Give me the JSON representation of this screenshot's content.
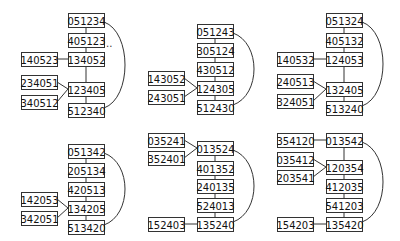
{
  "figure": {
    "box_width": 36,
    "box_height": 14,
    "colors": {
      "stroke": "#333333",
      "fill": "#ffffff",
      "text": "#111111"
    }
  },
  "panels": [
    {
      "id": "panel-1",
      "nodes": [
        {
          "id": "a",
          "label": "051234",
          "x": 68,
          "y": 13
        },
        {
          "id": "b",
          "label": "405123",
          "x": 68,
          "y": 33
        },
        {
          "id": "c",
          "label": "134052",
          "x": 68,
          "y": 52
        },
        {
          "id": "d",
          "label": "140523",
          "x": 21,
          "y": 52
        },
        {
          "id": "e",
          "label": "234051",
          "x": 21,
          "y": 75
        },
        {
          "id": "f",
          "label": "123405",
          "x": 68,
          "y": 82
        },
        {
          "id": "g",
          "label": "340512",
          "x": 21,
          "y": 95
        },
        {
          "id": "h",
          "label": "512340",
          "x": 68,
          "y": 103
        }
      ],
      "edges": [
        [
          "a",
          "b",
          "v"
        ],
        [
          "b",
          "c",
          "v"
        ],
        [
          "c",
          "f",
          "v"
        ],
        [
          "f",
          "h",
          "v"
        ],
        [
          "d",
          "c",
          "h"
        ],
        [
          "e",
          "f",
          "d"
        ],
        [
          "g",
          "f",
          "d"
        ]
      ],
      "arc": [
        "a",
        "h"
      ],
      "ellipsis": {
        "text": "..",
        "x": 106,
        "y": 47
      }
    },
    {
      "id": "panel-2",
      "nodes": [
        {
          "id": "a",
          "label": "051243",
          "x": 197,
          "y": 24
        },
        {
          "id": "b",
          "label": "305124",
          "x": 197,
          "y": 43
        },
        {
          "id": "c",
          "label": "430512",
          "x": 197,
          "y": 62
        },
        {
          "id": "d",
          "label": "143052",
          "x": 148,
          "y": 71
        },
        {
          "id": "e",
          "label": "124305",
          "x": 197,
          "y": 81
        },
        {
          "id": "f",
          "label": "243051",
          "x": 148,
          "y": 90
        },
        {
          "id": "g",
          "label": "512430",
          "x": 197,
          "y": 100
        }
      ],
      "edges": [
        [
          "a",
          "b",
          "v"
        ],
        [
          "b",
          "c",
          "v"
        ],
        [
          "c",
          "e",
          "v"
        ],
        [
          "e",
          "g",
          "v"
        ],
        [
          "d",
          "e",
          "d"
        ],
        [
          "f",
          "e",
          "d"
        ]
      ],
      "arc": [
        "a",
        "g"
      ]
    },
    {
      "id": "panel-3",
      "nodes": [
        {
          "id": "a",
          "label": "051324",
          "x": 326,
          "y": 13
        },
        {
          "id": "b",
          "label": "405132",
          "x": 326,
          "y": 33
        },
        {
          "id": "c",
          "label": "124053",
          "x": 326,
          "y": 52
        },
        {
          "id": "d",
          "label": "140532",
          "x": 277,
          "y": 52
        },
        {
          "id": "e",
          "label": "240513",
          "x": 277,
          "y": 74
        },
        {
          "id": "f",
          "label": "132405",
          "x": 326,
          "y": 82
        },
        {
          "id": "g",
          "label": "324051",
          "x": 277,
          "y": 94
        },
        {
          "id": "h",
          "label": "513240",
          "x": 326,
          "y": 101
        }
      ],
      "edges": [
        [
          "a",
          "b",
          "v"
        ],
        [
          "b",
          "c",
          "v"
        ],
        [
          "c",
          "f",
          "v"
        ],
        [
          "f",
          "h",
          "v"
        ],
        [
          "d",
          "c",
          "h"
        ],
        [
          "e",
          "f",
          "d"
        ],
        [
          "g",
          "f",
          "d"
        ]
      ],
      "arc": [
        "a",
        "h"
      ]
    },
    {
      "id": "panel-4",
      "nodes": [
        {
          "id": "a",
          "label": "051342",
          "x": 68,
          "y": 144
        },
        {
          "id": "b",
          "label": "205134",
          "x": 68,
          "y": 163
        },
        {
          "id": "c",
          "label": "420513",
          "x": 68,
          "y": 182
        },
        {
          "id": "d",
          "label": "142053",
          "x": 21,
          "y": 192
        },
        {
          "id": "e",
          "label": "134205",
          "x": 68,
          "y": 201
        },
        {
          "id": "f",
          "label": "342051",
          "x": 21,
          "y": 211
        },
        {
          "id": "g",
          "label": "513420",
          "x": 68,
          "y": 220
        }
      ],
      "edges": [
        [
          "a",
          "b",
          "v"
        ],
        [
          "b",
          "c",
          "v"
        ],
        [
          "c",
          "e",
          "v"
        ],
        [
          "e",
          "g",
          "v"
        ],
        [
          "d",
          "e",
          "d"
        ],
        [
          "f",
          "e",
          "d"
        ]
      ],
      "arc": [
        "a",
        "g"
      ]
    },
    {
      "id": "panel-5",
      "nodes": [
        {
          "id": "a",
          "label": "035241",
          "x": 148,
          "y": 133
        },
        {
          "id": "b",
          "label": "013524",
          "x": 197,
          "y": 141
        },
        {
          "id": "c",
          "label": "352401",
          "x": 148,
          "y": 151
        },
        {
          "id": "d",
          "label": "401352",
          "x": 197,
          "y": 161
        },
        {
          "id": "e",
          "label": "240135",
          "x": 197,
          "y": 179
        },
        {
          "id": "f",
          "label": "524013",
          "x": 197,
          "y": 198
        },
        {
          "id": "g",
          "label": "152403",
          "x": 148,
          "y": 217
        },
        {
          "id": "h",
          "label": "135240",
          "x": 197,
          "y": 217
        }
      ],
      "edges": [
        [
          "b",
          "d",
          "v"
        ],
        [
          "d",
          "e",
          "v"
        ],
        [
          "e",
          "f",
          "v"
        ],
        [
          "f",
          "h",
          "v"
        ],
        [
          "a",
          "b",
          "d"
        ],
        [
          "c",
          "b",
          "d"
        ],
        [
          "g",
          "h",
          "h"
        ]
      ],
      "arc": [
        "b",
        "h"
      ]
    },
    {
      "id": "panel-6",
      "nodes": [
        {
          "id": "a",
          "label": "354120",
          "x": 277,
          "y": 133
        },
        {
          "id": "b",
          "label": "013542",
          "x": 326,
          "y": 133
        },
        {
          "id": "c",
          "label": "035412",
          "x": 277,
          "y": 152
        },
        {
          "id": "d",
          "label": "120354",
          "x": 326,
          "y": 160
        },
        {
          "id": "e",
          "label": "203541",
          "x": 277,
          "y": 170
        },
        {
          "id": "f",
          "label": "412035",
          "x": 326,
          "y": 179
        },
        {
          "id": "g",
          "label": "541203",
          "x": 326,
          "y": 198
        },
        {
          "id": "h",
          "label": "154203",
          "x": 277,
          "y": 217
        },
        {
          "id": "i",
          "label": "135420",
          "x": 326,
          "y": 217
        }
      ],
      "edges": [
        [
          "b",
          "d",
          "v"
        ],
        [
          "d",
          "f",
          "v"
        ],
        [
          "f",
          "g",
          "v"
        ],
        [
          "g",
          "i",
          "v"
        ],
        [
          "a",
          "b",
          "h"
        ],
        [
          "c",
          "d",
          "d"
        ],
        [
          "e",
          "d",
          "d"
        ],
        [
          "h",
          "i",
          "h"
        ]
      ],
      "arc": [
        "b",
        "i"
      ]
    }
  ]
}
